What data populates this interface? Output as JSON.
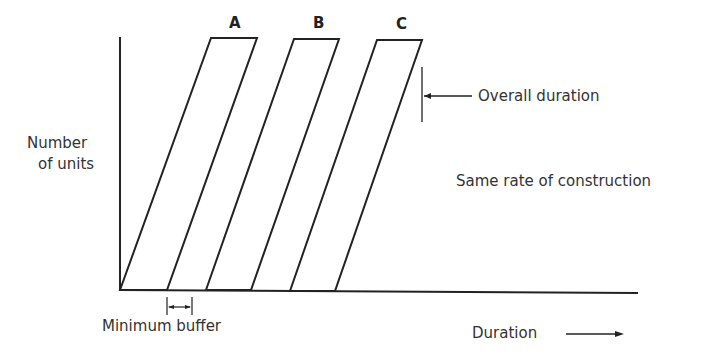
{
  "diagram": {
    "y_axis_label_line1": "Number",
    "y_axis_label_line2": "of units",
    "x_axis_label": "Duration",
    "bars": [
      {
        "label": "A"
      },
      {
        "label": "B"
      },
      {
        "label": "C"
      }
    ],
    "annotations": {
      "overall_duration": "Overall duration",
      "same_rate": "Same rate of construction",
      "minimum_buffer": "Minimum buffer"
    },
    "line_color": "#222222"
  }
}
